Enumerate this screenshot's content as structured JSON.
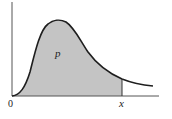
{
  "diagram": {
    "title": "",
    "type": "probability-density-curve",
    "labels": {
      "origin": "0",
      "x_marker": "x",
      "area": "p"
    },
    "colors": {
      "shaded_area": "#c4c4c4",
      "curve": "#1e1e1e",
      "axes": "#555555",
      "background": "#ffffff"
    }
  }
}
